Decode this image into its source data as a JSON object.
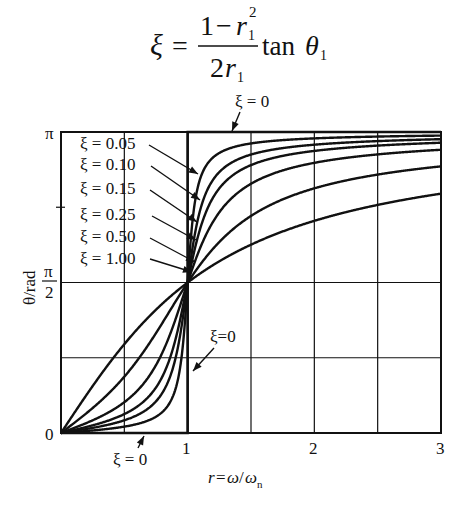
{
  "formula": {
    "lhs": "ξ",
    "equals": "=",
    "numerator": "1 − r₁²",
    "numerator_parts": {
      "one": "1",
      "minus": "−",
      "r": "r",
      "sub": "1",
      "sup": "2"
    },
    "denominator_parts": {
      "coef": "2",
      "r": "r",
      "sub": "1"
    },
    "func": "tan",
    "arg": "θ",
    "arg_sub": "1"
  },
  "chart_data": {
    "type": "line",
    "xlabel": "r = ω/ωn",
    "xlabel_parts": {
      "r": "r",
      "eq": "=",
      "omega": "ω",
      "slash": "/",
      "omega_n": "ω",
      "sub": "n"
    },
    "ylabel": "θ/rad",
    "xlim": [
      0,
      3
    ],
    "ylim": [
      0,
      3.14159
    ],
    "x_ticks": [
      {
        "value": 0,
        "label": "0"
      },
      {
        "value": 1,
        "label": "1"
      },
      {
        "value": 2,
        "label": "2"
      },
      {
        "value": 3,
        "label": "3"
      }
    ],
    "y_ticks": [
      {
        "value": 0,
        "label": "0"
      },
      {
        "value": 1.5708,
        "label": "π/2"
      },
      {
        "value": 3.14159,
        "label": "π"
      }
    ],
    "x_grid": [
      0.5,
      1,
      1.5,
      2,
      2.5
    ],
    "y_grid": [
      0.7854,
      1.5708
    ],
    "y_minor_tick": [
      2.3562
    ],
    "grid": true,
    "formula_note": "θ = arctan(2ξr / (1 − r²))",
    "series": [
      {
        "name": "ξ = 0.05",
        "zeta": 0.05,
        "x": [
          0,
          0.5,
          0.8,
          0.9,
          1.0,
          1.1,
          1.2,
          1.5,
          2,
          2.5,
          3
        ],
        "values": [
          0,
          0.07,
          0.22,
          0.44,
          1.571,
          2.66,
          2.91,
          3.06,
          3.11,
          3.12,
          3.13
        ]
      },
      {
        "name": "ξ = 0.10",
        "zeta": 0.1,
        "x": [
          0,
          0.5,
          0.8,
          0.9,
          1.0,
          1.1,
          1.2,
          1.5,
          2,
          2.5,
          3
        ],
        "values": [
          0,
          0.13,
          0.42,
          0.76,
          1.571,
          2.33,
          2.67,
          2.97,
          3.07,
          3.1,
          3.1
        ]
      },
      {
        "name": "ξ = 0.15",
        "zeta": 0.15,
        "x": [
          0,
          0.5,
          0.8,
          0.9,
          1.0,
          1.1,
          1.2,
          1.5,
          2,
          2.5,
          3
        ],
        "values": [
          0,
          0.2,
          0.59,
          0.96,
          1.571,
          2.08,
          2.45,
          2.89,
          3.04,
          3.07,
          3.08
        ]
      },
      {
        "name": "ξ = 0.25",
        "zeta": 0.25,
        "x": [
          0,
          0.5,
          0.8,
          0.9,
          1.0,
          1.1,
          1.2,
          1.5,
          2,
          2.5,
          3
        ],
        "values": [
          0,
          0.32,
          0.84,
          1.17,
          1.571,
          1.89,
          2.14,
          2.68,
          2.97,
          3.03,
          3.05
        ]
      },
      {
        "name": "ξ = 0.50",
        "zeta": 0.5,
        "x": [
          0,
          0.5,
          0.8,
          0.9,
          1.0,
          1.1,
          1.2,
          1.5,
          2,
          2.5,
          3
        ],
        "values": [
          0,
          0.59,
          1.15,
          1.36,
          1.571,
          1.76,
          1.92,
          2.27,
          2.55,
          2.7,
          2.78
        ]
      },
      {
        "name": "ξ = 1.00",
        "zeta": 1.0,
        "x": [
          0,
          0.5,
          0.8,
          0.9,
          1.0,
          1.1,
          1.2,
          1.5,
          2,
          2.5,
          3
        ],
        "values": [
          0,
          0.93,
          1.35,
          1.46,
          1.571,
          1.67,
          1.75,
          1.97,
          2.21,
          2.37,
          2.5
        ]
      },
      {
        "name": "ξ = 0",
        "zeta": 0,
        "x": [
          0,
          1,
          1,
          3
        ],
        "values": [
          0,
          0,
          3.14159,
          3.14159
        ]
      }
    ],
    "annotations": [
      {
        "text": "ξ = 0",
        "position": "above plot, arrow to top edge near r≈0.9"
      },
      {
        "text": "ξ=0",
        "position": "right of r=1 line, arrow down-left to vertical jump"
      },
      {
        "text": "ξ = 0",
        "position": "below x-axis, arrow to bottom edge near r≈0.6"
      }
    ]
  },
  "labels": {
    "zeta_labels": [
      "ξ = 0.05",
      "ξ = 0.10",
      "ξ = 0.15",
      "ξ = 0.25",
      "ξ = 0.50",
      "ξ = 1.00"
    ],
    "zeta0_top": "ξ = 0",
    "zeta0_mid": "ξ=0",
    "zeta0_bottom": "ξ = 0",
    "y_pi": "π",
    "y_half_num": "π",
    "y_half_den": "2",
    "y_zero": "0",
    "ylabel": "θ/rad"
  },
  "colors": {
    "ink": "#111111",
    "background": "#ffffff"
  }
}
